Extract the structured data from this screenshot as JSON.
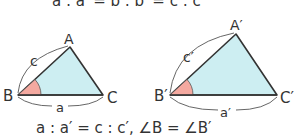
{
  "top_equation": "a : a′ = b : b′ = c : c′",
  "bottom_equation": "a : a′ = c : c′, ∠B = ∠B′",
  "colors": {
    "triangle_fill": "#cdeef2",
    "angle_fill": "#f4a9a0",
    "stroke": "#333333",
    "arc_stroke": "#555555"
  },
  "triangle1": {
    "vertices": {
      "A": "A",
      "B": "B",
      "C": "C"
    },
    "sides": {
      "c": "c",
      "a": "a"
    }
  },
  "triangle2": {
    "vertices": {
      "A": "A′",
      "B": "B′",
      "C": "C′"
    },
    "sides": {
      "c": "c′",
      "a": "a′"
    }
  }
}
